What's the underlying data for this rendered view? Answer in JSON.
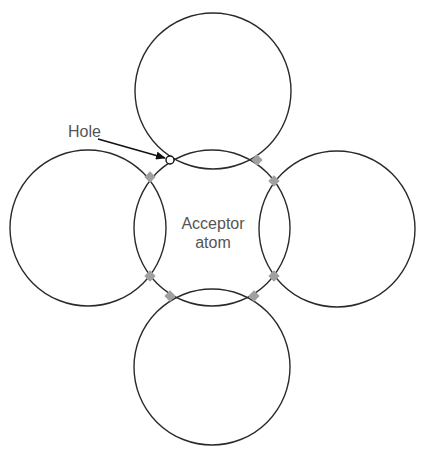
{
  "diagram": {
    "labels": {
      "hole": "Hole",
      "acceptor_line1": "Acceptor",
      "acceptor_line2": "atom"
    },
    "colors": {
      "stroke": "#2a2a2a",
      "bond_dot": "#a0a0a0",
      "text": "#555555",
      "background": "#ffffff"
    },
    "atoms": [
      {
        "name": "top-atom",
        "cx": 213,
        "cy": 91,
        "r": 78
      },
      {
        "name": "left-atom",
        "cx": 88,
        "cy": 228,
        "r": 78
      },
      {
        "name": "acceptor-atom",
        "cx": 212,
        "cy": 228,
        "r": 78
      },
      {
        "name": "right-atom",
        "cx": 337,
        "cy": 229,
        "r": 78
      },
      {
        "name": "bottom-atom",
        "cx": 212,
        "cy": 367,
        "r": 78
      }
    ],
    "bonds": [
      {
        "x": 257,
        "y": 160
      },
      {
        "x": 150,
        "y": 177
      },
      {
        "x": 274,
        "y": 181
      },
      {
        "x": 150,
        "y": 276
      },
      {
        "x": 274,
        "y": 276
      },
      {
        "x": 170,
        "y": 296
      },
      {
        "x": 254,
        "y": 296
      }
    ],
    "hole": {
      "x": 170,
      "y": 160
    }
  }
}
